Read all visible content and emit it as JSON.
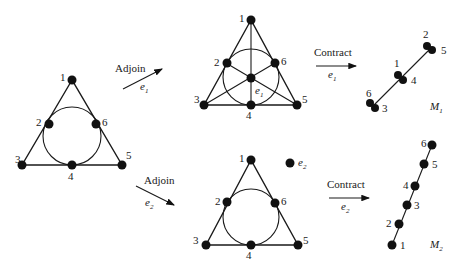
{
  "figure": {
    "type": "matroid adjoin/contract diagram",
    "colors": {
      "ink": "#111111",
      "background": "#ffffff"
    }
  },
  "original": {
    "points": [
      "1",
      "2",
      "3",
      "4",
      "5",
      "6"
    ]
  },
  "top_path": {
    "adjoin_label": "Adjoin",
    "adjoin_element": "e",
    "adjoin_element_sub": "1",
    "fano": {
      "points": [
        "1",
        "2",
        "3",
        "4",
        "5",
        "6"
      ],
      "center_label": "e",
      "center_label_sub": "1"
    },
    "contract_label": "Contract",
    "contract_element": "e",
    "contract_element_sub": "1",
    "result": {
      "name": "M",
      "name_sub": "1",
      "pairs": [
        {
          "a": "2",
          "b": "5"
        },
        {
          "a": "1",
          "b": "4"
        },
        {
          "a": "6",
          "b": "3"
        }
      ]
    }
  },
  "bottom_path": {
    "adjoin_label": "Adjoin",
    "adjoin_element": "e",
    "adjoin_element_sub": "2",
    "extended": {
      "points": [
        "1",
        "2",
        "3",
        "4",
        "5",
        "6"
      ],
      "loose_point_label": "e",
      "loose_point_sub": "2"
    },
    "contract_label": "Contract",
    "contract_element": "e",
    "contract_element_sub": "2",
    "result": {
      "name": "M",
      "name_sub": "2",
      "points": [
        "1",
        "2",
        "3",
        "4",
        "5",
        "6"
      ]
    }
  }
}
